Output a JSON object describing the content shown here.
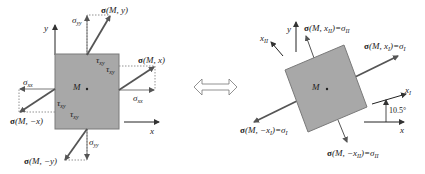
{
  "diagram": {
    "left": {
      "title": "stress state at point M in x-y coordinates",
      "point": "M",
      "axes": {
        "x": "x",
        "y": "y"
      },
      "labels": {
        "sigma_M_y": {
          "bold": "σ",
          "rest": "(M, y)"
        },
        "sigma_M_x": {
          "bold": "σ",
          "rest": "(M, x)"
        },
        "sigma_M_neg_x": {
          "bold": "σ",
          "rest": "(M, −x)"
        },
        "sigma_M_neg_y": {
          "bold": "σ",
          "rest": "(M, −y)"
        },
        "sigma_yy_top": {
          "main": "σ",
          "sub": "yy"
        },
        "sigma_yy_bottom": {
          "main": "σ",
          "sub": "yy"
        },
        "sigma_xx_left": {
          "main": "σ",
          "sub": "xx"
        },
        "sigma_xx_right": {
          "main": "σ",
          "sub": "xx"
        },
        "tau_xy_top": {
          "main": "τ",
          "sub": "xy"
        },
        "tau_xy_right": {
          "main": "τ",
          "sub": "xy"
        },
        "tau_xy_left": {
          "main": "τ",
          "sub": "xy"
        },
        "tau_xy_bottom": {
          "main": "τ",
          "sub": "xy"
        }
      }
    },
    "equivalence_arrow": "double-headed-arrow",
    "right": {
      "title": "principal stress state at point M",
      "point": "M",
      "axes": {
        "y": "y",
        "x": "x",
        "x1": {
          "main": "x",
          "sub": "I"
        },
        "x2": {
          "main": "x",
          "sub": "II"
        }
      },
      "angle": "10.5°",
      "labels": {
        "sigma_M_xII": {
          "bold": "σ",
          "rest": "(M, x",
          "sub": "II",
          "eq": ")=σ",
          "eqsub": "II"
        },
        "sigma_M_xI": {
          "bold": "σ",
          "rest": "(M, x",
          "sub": "I",
          "eq": ")=σ",
          "eqsub": "I"
        },
        "sigma_M_neg_xI": {
          "bold": "σ",
          "rest": "(M, −x",
          "sub": "I",
          "eq": ")=σ",
          "eqsub": "I"
        },
        "sigma_M_neg_xII": {
          "bold": "σ",
          "rest": "(M, −x",
          "sub": "II",
          "eq": ")=σ",
          "eqsub": "II"
        }
      }
    },
    "colors": {
      "element_fill": "#a8a8a8",
      "element_stroke": "#7a7a7a",
      "vector": "#555555",
      "axis": "#222222",
      "dotted": "#777777"
    }
  }
}
